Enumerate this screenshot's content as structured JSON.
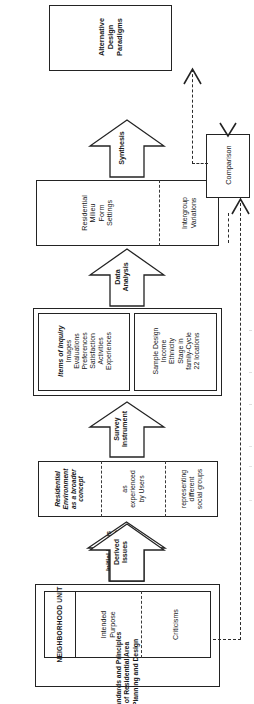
{
  "diagram": {
    "orientation": "rotated-90",
    "nodes": {
      "alternative_design_paradigms": {
        "name": "alternative-design-paradigms-box",
        "lines": [
          "Alternative",
          "Design",
          "Paradigms"
        ]
      },
      "comparison": {
        "name": "comparison-box",
        "lines": [
          "Comparison"
        ]
      },
      "findings": {
        "name": "findings-box",
        "left": {
          "lines": [
            "Residential",
            "Milieu",
            "Form",
            "Settings"
          ]
        },
        "right": {
          "lines": [
            "Intergroup",
            "Variations"
          ]
        }
      },
      "survey_design": {
        "name": "survey-design-box",
        "left": {
          "title": "Items of Inquiry",
          "lines": [
            "Images",
            "Evaluations",
            "Preferences",
            "Satisfaction",
            "Activities",
            "Experiences"
          ]
        },
        "right": {
          "title": "Sample Design",
          "lines": [
            "Income",
            "Ethnicity",
            "Stage in",
            "family-Cycle",
            "22 locations"
          ]
        }
      },
      "issues": {
        "name": "issues-box",
        "sections": [
          {
            "lines": [
              "Residential",
              "Environment",
              "as a broader",
              "concept"
            ],
            "italic": true
          },
          {
            "lines": [
              "as",
              "experienced",
              "by Users"
            ],
            "italic": false
          },
          {
            "lines": [
              "representing",
              "different",
              "social groups"
            ],
            "italic": false
          }
        ]
      },
      "neighborhood": {
        "name": "neighborhood-unit-box",
        "inner_sections": [
          {
            "lines": [
              "NEIGHBORHOOD UNIT"
            ],
            "style": "caps"
          },
          {
            "lines": [
              "Intended",
              "Purpose"
            ],
            "style": "normal"
          },
          {
            "lines": [
              "Criticisms"
            ],
            "style": "normal"
          }
        ],
        "outer_label": {
          "lines": [
            "Standards and Principles",
            "of Residential Area",
            "Planning and Design"
          ]
        }
      }
    },
    "arrows": [
      {
        "name": "synthesis-arrow",
        "lines": [
          "Synthesis"
        ]
      },
      {
        "name": "data-analysis-arrow",
        "lines": [
          "Data",
          "Analysis"
        ]
      },
      {
        "name": "survey-instrument-arrow",
        "lines": [
          "Survey",
          "Instrument"
        ]
      },
      {
        "name": "derived-issues-arrow",
        "lines": [
          "Derived",
          "Issues"
        ]
      },
      {
        "name": "initial-focus-arrow",
        "lines": [
          "Initial Focus",
          "for Research",
          "Issues"
        ]
      }
    ],
    "connectors": [
      {
        "name": "findings-to-comparison-connector",
        "style": "dashed"
      },
      {
        "name": "neighborhood-to-comparison-connector",
        "style": "dashed"
      },
      {
        "name": "comparison-to-paradigms-connector",
        "style": "dashed"
      }
    ],
    "colors": {
      "ink": "#232323",
      "paper": "#ffffff",
      "dash": "#2b2b2b"
    }
  }
}
